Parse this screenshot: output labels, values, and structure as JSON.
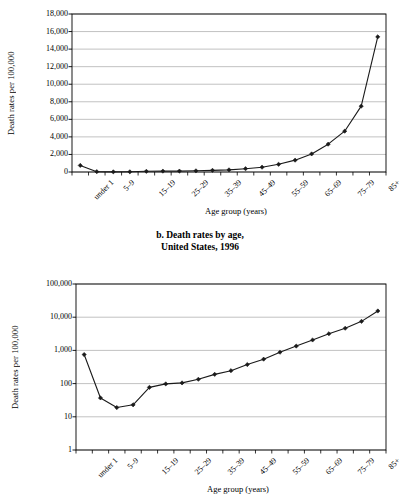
{
  "caption": {
    "line1": "b. Death rates by age,",
    "line2": "United States, 1996"
  },
  "chart_data": [
    {
      "id": "chart-a",
      "type": "line",
      "title": "",
      "scale": "linear",
      "xlabel": "Age group (years)",
      "ylabel": "Death rates per 100,000",
      "grid": true,
      "legend": "none",
      "markers": "filled-diamond",
      "ylim": [
        0,
        18000
      ],
      "yticks": [
        0,
        2000,
        4000,
        6000,
        8000,
        10000,
        12000,
        14000,
        16000,
        18000
      ],
      "ytick_labels": [
        "0",
        "2,000",
        "4,000",
        "6,000",
        "8,000",
        "10,000",
        "12,000",
        "14,000",
        "16,000",
        "18,000"
      ],
      "categories": [
        "under 1",
        "1–4",
        "5–9",
        "10–14",
        "15–19",
        "20–24",
        "25–29",
        "30–34",
        "35–39",
        "40–44",
        "45–49",
        "50–54",
        "55–59",
        "60–64",
        "65–69",
        "70–74",
        "75–79",
        "80–84",
        "85+"
      ],
      "xtick_labels_shown": [
        "under 1",
        "5–9",
        "15–19",
        "25–29",
        "35–39",
        "45–49",
        "55–59",
        "65–69",
        "75–79",
        "85+"
      ],
      "values": [
        750,
        37,
        19,
        23,
        77,
        98,
        105,
        135,
        190,
        245,
        375,
        545,
        880,
        1350,
        2060,
        3170,
        4650,
        7500,
        15400
      ]
    },
    {
      "id": "chart-b",
      "type": "line",
      "title": "",
      "scale": "log",
      "xlabel": "Age group (years)",
      "ylabel": "Death rates per 100,000",
      "grid": true,
      "legend": "none",
      "markers": "filled-diamond",
      "ylim": [
        1,
        100000
      ],
      "yticks": [
        1,
        10,
        100,
        1000,
        10000,
        100000
      ],
      "ytick_labels": [
        "1",
        "10",
        "100",
        "1,000",
        "10,000",
        "100,000"
      ],
      "categories": [
        "under 1",
        "1–4",
        "5–9",
        "10–14",
        "15–19",
        "20–24",
        "25–29",
        "30–34",
        "35–39",
        "40–44",
        "45–49",
        "50–54",
        "55–59",
        "60–64",
        "65–69",
        "70–74",
        "75–79",
        "80–84",
        "85+"
      ],
      "xtick_labels_shown": [
        "under 1",
        "5–9",
        "15–19",
        "25–29",
        "35–39",
        "45–49",
        "55–59",
        "65–69",
        "75–79",
        "85+"
      ],
      "values": [
        750,
        37,
        19,
        23,
        77,
        98,
        105,
        135,
        190,
        245,
        375,
        545,
        880,
        1350,
        2060,
        3170,
        4650,
        7500,
        15400
      ]
    }
  ],
  "style": {
    "line_color": "#1a1a1a",
    "grid_color": "#a8a8a8",
    "axis_color": "#000000",
    "background": "#ffffff"
  }
}
